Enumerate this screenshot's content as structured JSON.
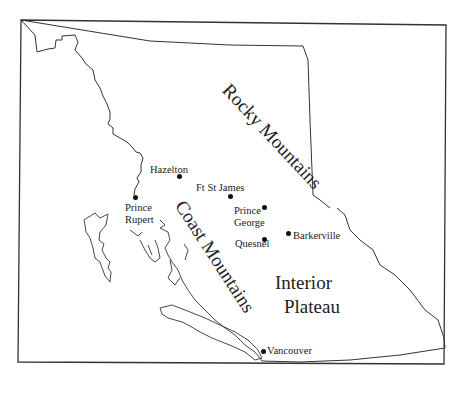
{
  "map": {
    "region": "British Columbia",
    "regions": [
      {
        "name": "rocky",
        "label": "Rocky Mountains"
      },
      {
        "name": "coast",
        "label": "Coast Mountains"
      },
      {
        "name": "interior_line1",
        "label": "Interior"
      },
      {
        "name": "interior_line2",
        "label": "Plateau"
      }
    ],
    "cities": {
      "hazelton": "Hazelton",
      "ft_st_james": "Ft St James",
      "prince_rupert_1": "Prince",
      "prince_rupert_2": "Rupert",
      "prince_george_1": "Prince",
      "prince_george_2": "George",
      "quesnel": "Quesnel",
      "barkerville": "Barkerville",
      "vancouver": "Vancouver"
    },
    "colors": {
      "line": "#222222",
      "background": "#ffffff"
    }
  }
}
